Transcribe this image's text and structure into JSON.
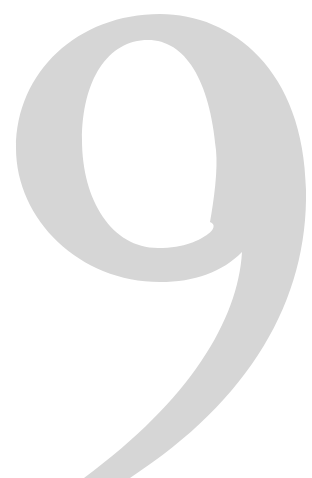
{
  "numeral": {
    "character": "9",
    "color": "#d6d6d6",
    "background": "#ffffff"
  }
}
